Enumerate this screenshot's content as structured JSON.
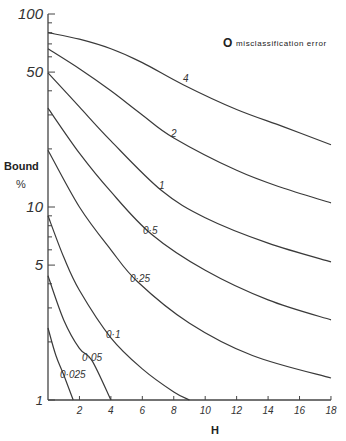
{
  "chart_data": {
    "type": "line",
    "title": "",
    "xlabel": "H",
    "ylabel": "Bound %",
    "xlim": [
      0,
      18
    ],
    "ylim": [
      1,
      100
    ],
    "yscale": "log",
    "grid": false,
    "x_ticks": [
      2,
      4,
      6,
      8,
      10,
      12,
      14,
      16,
      18
    ],
    "y_tick_labels": [
      "1",
      "5",
      "10",
      "50",
      "100"
    ],
    "y_ticks": [
      1,
      5,
      10,
      50,
      100
    ],
    "legend": {
      "symbol": "O",
      "text": "misclassification error",
      "position": "upper right"
    },
    "series": [
      {
        "name": "4",
        "label": "4",
        "x": [
          0,
          2,
          4,
          6,
          8.6,
          12,
          15,
          18
        ],
        "y": [
          80,
          74,
          66,
          56,
          43,
          32,
          26,
          21
        ]
      },
      {
        "name": "2",
        "label": "2",
        "x": [
          0,
          2,
          4,
          6,
          8,
          12,
          15,
          18
        ],
        "y": [
          66,
          52,
          40,
          30,
          22.8,
          15.5,
          12.5,
          10.5
        ]
      },
      {
        "name": "1",
        "label": "1",
        "x": [
          0,
          2,
          4,
          7.2,
          10,
          14,
          18
        ],
        "y": [
          49.5,
          33,
          22,
          12.2,
          8.8,
          6.5,
          5.2
        ]
      },
      {
        "name": "0.5",
        "label": "0·5",
        "x": [
          0,
          2,
          4,
          6.6,
          10,
          14,
          18
        ],
        "y": [
          32.5,
          19,
          12,
          7.2,
          4.7,
          3.3,
          2.6
        ]
      },
      {
        "name": "0.25",
        "label": "0·25",
        "x": [
          0,
          2,
          4,
          5.7,
          9,
          13,
          18
        ],
        "y": [
          19.7,
          10,
          6,
          4.1,
          2.5,
          1.7,
          1.3
        ]
      },
      {
        "name": "0.1",
        "label": "0·1",
        "x": [
          0,
          1,
          2,
          4,
          6,
          8,
          9
        ],
        "y": [
          9,
          5.5,
          3.7,
          2.1,
          1.45,
          1.1,
          1.0
        ]
      },
      {
        "name": "0.05",
        "label": "0·05",
        "x": [
          0,
          1,
          2,
          2.8,
          4
        ],
        "y": [
          4.4,
          2.6,
          1.85,
          1.6,
          1.0
        ]
      },
      {
        "name": "0.025",
        "label": "0·025",
        "x": [
          0,
          0.5,
          1,
          1.6
        ],
        "y": [
          2.36,
          1.7,
          1.35,
          1.0
        ]
      }
    ]
  },
  "axes": {
    "x_title": "H",
    "y_title_line1": "Bound",
    "y_title_line2": "%"
  },
  "legend": {
    "symbol": "O",
    "text": "misclassification error"
  }
}
